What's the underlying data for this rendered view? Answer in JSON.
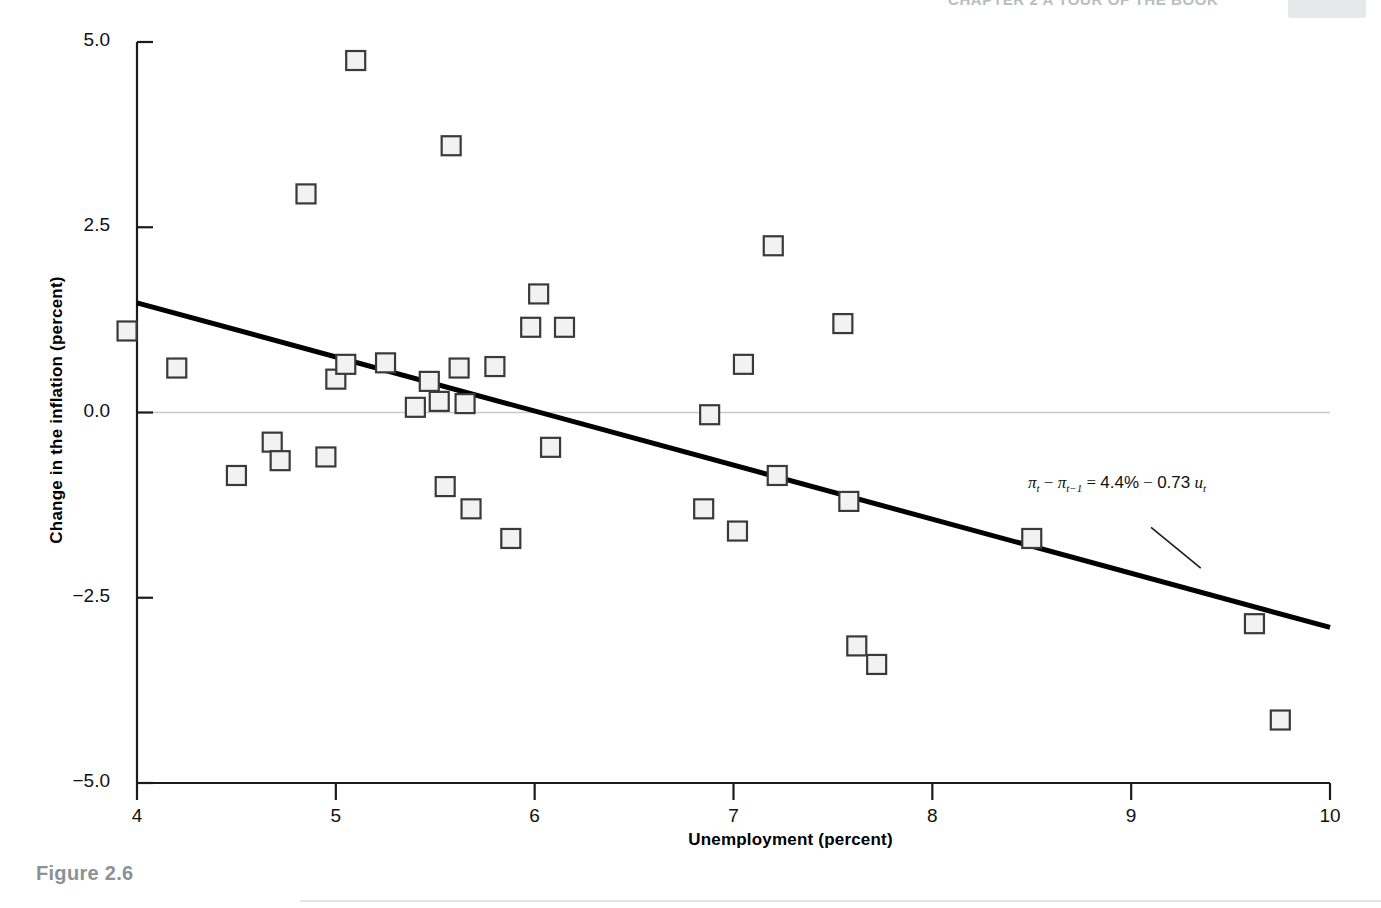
{
  "page": {
    "running_header": "CHAPTER 2  A TOUR OF THE BOOK",
    "caption": "Figure 2.6"
  },
  "chart_data": {
    "type": "scatter",
    "title": "",
    "xlabel": "Unemployment (percent)",
    "ylabel": "Change in the inflation (percent)",
    "xlim": [
      4,
      10
    ],
    "ylim": [
      -5.0,
      5.0
    ],
    "xticks": [
      "4",
      "5",
      "6",
      "7",
      "8",
      "9",
      "10"
    ],
    "xtick_values": [
      4,
      5,
      6,
      7,
      8,
      9,
      10
    ],
    "yticks": [
      "5.0",
      "2.5",
      "0.0",
      "-2.5",
      "-5.0"
    ],
    "ytick_values": [
      5.0,
      2.5,
      0.0,
      -2.5,
      -5.0
    ],
    "grid": false,
    "zero_line": true,
    "legend": "none",
    "marker": "open-square",
    "marker_color": "#f2f2f2",
    "marker_edge_color": "#3a3a3a",
    "line_color": "#000000",
    "annotation": {
      "text": "πt − πt−1 = 4.4% − 0.73 ut",
      "parts": {
        "pi": "π",
        "t": "t",
        "t_minus_1": "t−1",
        "minus": "−",
        "equals": "=",
        "intercept": "4.4%",
        "slope": "0.73",
        "u": "u"
      },
      "x": 9.1,
      "y": -1.15,
      "leader_line": {
        "x1": 9.1,
        "y1": -1.55,
        "x2": 9.35,
        "y2": -2.1
      }
    },
    "fit_line": {
      "name": "Regression line",
      "intercept": 4.4,
      "slope": -0.73,
      "x": [
        4.0,
        10.0
      ],
      "y": [
        1.48,
        -2.9
      ]
    },
    "series": [
      {
        "name": "US data 1970-2010",
        "x": [
          3.95,
          4.2,
          4.5,
          4.68,
          4.72,
          4.85,
          4.95,
          5.0,
          5.05,
          5.1,
          5.25,
          5.4,
          5.47,
          5.52,
          5.55,
          5.58,
          5.62,
          5.65,
          5.68,
          5.8,
          5.88,
          5.98,
          6.02,
          6.08,
          6.15,
          6.85,
          6.88,
          7.02,
          7.05,
          7.2,
          7.22,
          7.55,
          7.58,
          7.62,
          7.72,
          8.5,
          9.62,
          9.75
        ],
        "y": [
          1.1,
          0.6,
          -0.85,
          -0.4,
          -0.65,
          2.95,
          -0.6,
          0.45,
          0.65,
          4.75,
          0.67,
          0.07,
          0.42,
          0.15,
          -1.0,
          3.6,
          0.6,
          0.12,
          -1.3,
          0.62,
          -1.7,
          1.15,
          1.6,
          -0.47,
          1.15,
          -1.3,
          -0.03,
          -1.6,
          0.65,
          2.25,
          -0.85,
          1.2,
          -1.2,
          -3.15,
          -3.4,
          -1.7,
          -2.85,
          -4.15
        ]
      }
    ]
  }
}
